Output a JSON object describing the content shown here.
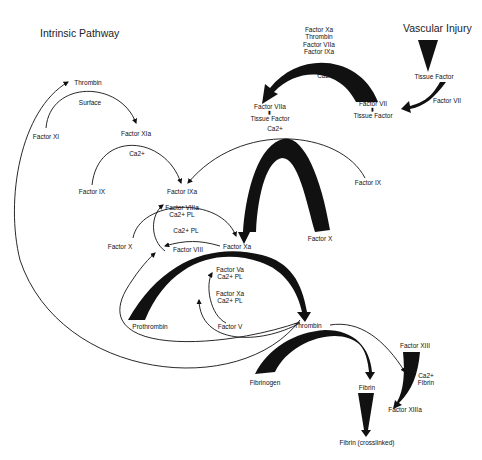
{
  "diagram": {
    "title_left": "Intrinsic Pathway",
    "title_right": "Vascular Injury",
    "nodes": {
      "thrombin_top": "Thrombin",
      "surface": "Surface",
      "factor_xi": "Factor XI",
      "factor_xia": "Factor XIa",
      "factor_ix_left": "Factor IX",
      "ca_ix": "Ca2+",
      "factor_ixa": "Factor IXa",
      "factor_viiia_stack": [
        "Factor VIIIa",
        "Ca2+ PL"
      ],
      "ca_pl_viii": "Ca2+ PL",
      "factor_x_left": "Factor X",
      "factor_viii": "Factor VIII",
      "factor_xa": "Factor Xa",
      "extrinsic_stack": [
        "Factor Xa",
        "Thrombin",
        "Factor VIIa",
        "Factor IXa"
      ],
      "ca_extrinsic": "Ca2+",
      "factor_viia_tf": [
        "Factor VIIa",
        "Tissue Factor"
      ],
      "factor_vii_tf": [
        "Factor VII",
        "Tissue Factor"
      ],
      "tissue_factor": "Tissue Factor",
      "factor_vii_right": "Factor VII",
      "ca_long": "Ca2+",
      "factor_ix_right": "Factor IX",
      "factor_x_right": "Factor X",
      "factor_va_stack": [
        "Factor Va",
        "Ca2+ PL"
      ],
      "factor_xa_stack": [
        "Factor Xa",
        "Ca2+ PL"
      ],
      "prothrombin": "Prothrombin",
      "factor_v": "Factor V",
      "thrombin": "Thrombin",
      "fibrinogen": "Fibrinogen",
      "fibrin": "Fibrin",
      "factor_xiii": "Factor XIII",
      "ca_fibrin": [
        "Ca2+",
        "Fibrin"
      ],
      "factor_xiiia": "Factor XIIIa",
      "fibrin_crosslinked": "Fibrin (crosslinked)"
    }
  }
}
